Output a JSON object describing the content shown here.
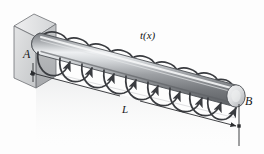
{
  "figure": {
    "type": "engineering-diagram",
    "background_color": "#fdfdfd",
    "labels": {
      "support_end": "A",
      "free_end": "B",
      "length": "L",
      "distributed_torque": "t(x)",
      "distributed_torque_base": "t",
      "distributed_torque_arg": "(x)"
    },
    "colors": {
      "shaft_dark": "#6f7276",
      "shaft_mid": "#9a9da1",
      "shaft_light": "#eceef0",
      "shaft_outline": "#4c4f53",
      "wall_front": "#d7d8da",
      "wall_top": "#e8e9ea",
      "wall_side": "#b9bbbd",
      "wall_outline": "#6d7074",
      "arrow": "#3a3c40",
      "dimension_line": "#2b2d30",
      "text": "#16171a"
    },
    "geometry": {
      "shaft_left_x": 40,
      "shaft_right_x": 236,
      "shaft_left_y": 44,
      "shaft_right_y": 96,
      "shaft_radius_y": 11,
      "torque_loop_count": 9
    }
  }
}
